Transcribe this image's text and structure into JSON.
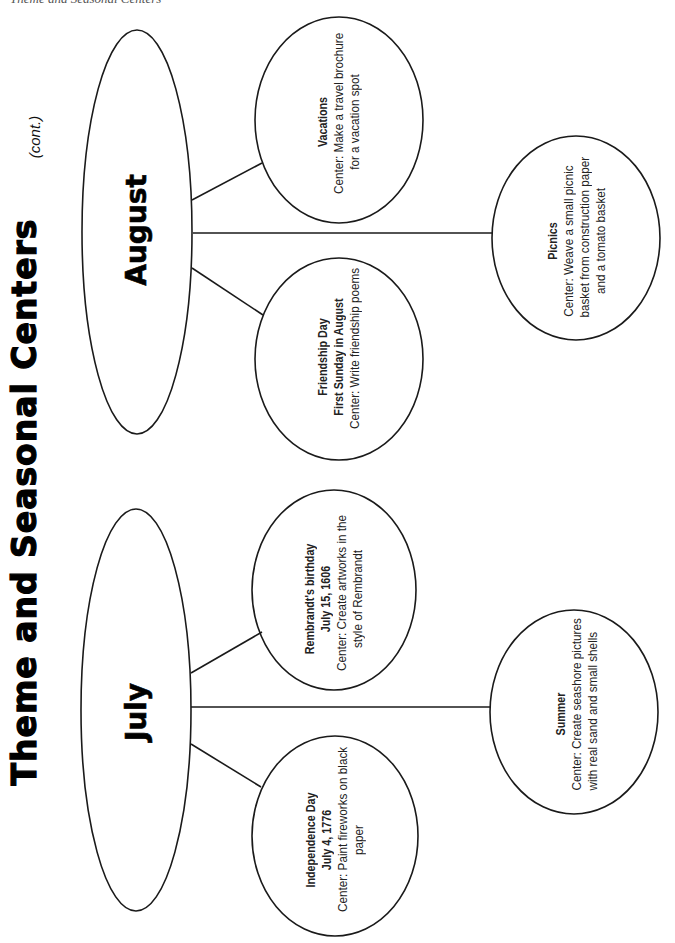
{
  "page": {
    "running_header": "Theme and Seasonal Centers",
    "title": "Theme and Seasonal Centers",
    "title_suffix": "(cont.)"
  },
  "months": [
    {
      "name": "August",
      "centers": [
        {
          "position": "upper",
          "heading_lines": [
            "Vacations"
          ],
          "center_lines": [
            "Center: Make a travel brochure",
            "for a vacation spot"
          ]
        },
        {
          "position": "middle",
          "heading_lines": [
            "Picnics"
          ],
          "center_lines": [
            "Center: Weave a small picnic",
            "basket from construction paper",
            "and a tomato basket"
          ]
        },
        {
          "position": "lower",
          "heading_lines": [
            "Friendship Day",
            "First Sunday in August"
          ],
          "center_lines": [
            "Center: Write friendship poems"
          ]
        }
      ]
    },
    {
      "name": "July",
      "centers": [
        {
          "position": "upper",
          "heading_lines": [
            "Rembrandt's birthday",
            "July 15, 1606"
          ],
          "center_lines": [
            "Center: Create artworks in the",
            "style of Rembrandt"
          ]
        },
        {
          "position": "middle",
          "heading_lines": [
            "Summer"
          ],
          "center_lines": [
            "Center: Create seashore pictures",
            "with real sand and small shells"
          ]
        },
        {
          "position": "lower",
          "heading_lines": [
            "Independence Day",
            "July 4, 1776"
          ],
          "center_lines": [
            "Center: Paint fireworks on black",
            "paper"
          ]
        }
      ]
    }
  ],
  "colors": {
    "stroke": "#1a1a1a",
    "text": "#222222",
    "background": "#ffffff"
  }
}
